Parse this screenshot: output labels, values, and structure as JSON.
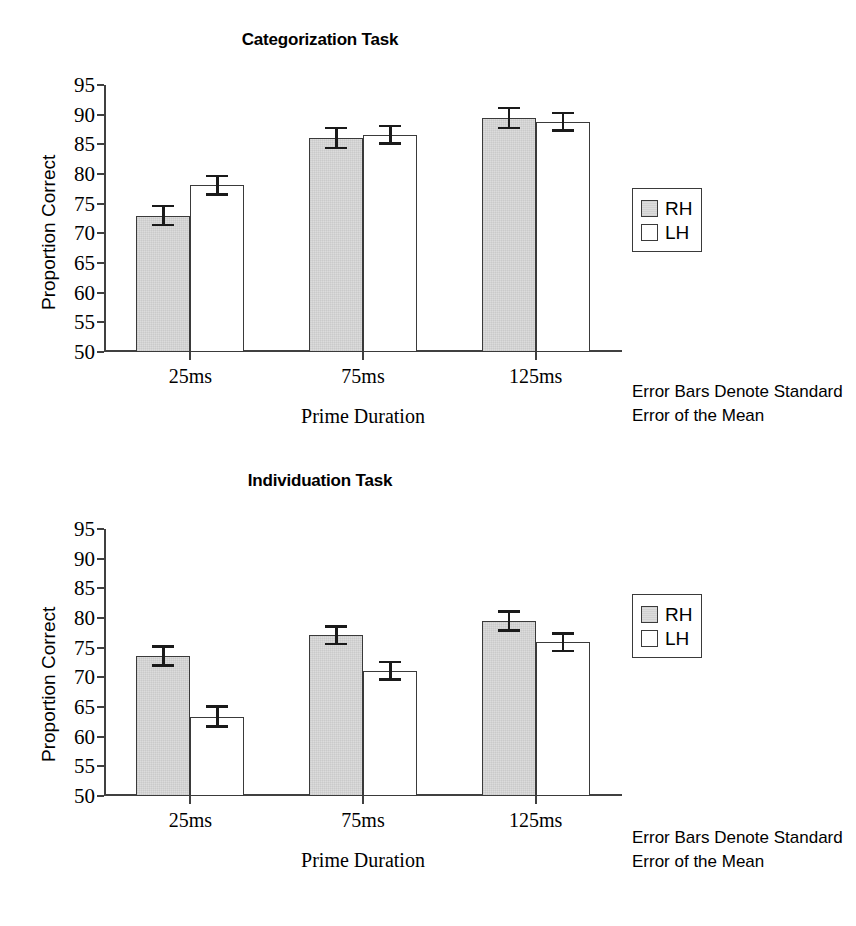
{
  "figure": {
    "background_color": "#ffffff",
    "bar_fill_rh": "#dcdcdc",
    "bar_fill_lh": "#ffffff",
    "bar_edge_color": "#3a3a3a",
    "axis_color": "#404040",
    "error_bar_color": "#1a1a1a"
  },
  "panels": [
    {
      "id": "categorization",
      "title": "Categorization Task",
      "ylabel": "Proportion Correct",
      "xlabel": "Prime Duration",
      "footnote": "Error Bars Denote Standard Error of the Mean",
      "legend": {
        "items": [
          {
            "label": "RH"
          },
          {
            "label": "LH"
          }
        ]
      },
      "yticks": [
        "95",
        "90",
        "85",
        "80",
        "75",
        "70",
        "65",
        "60",
        "55",
        "50"
      ],
      "xticks": [
        "25ms",
        "75ms",
        "125ms"
      ]
    },
    {
      "id": "individuation",
      "title": "Individuation Task",
      "ylabel": "Proportion Correct",
      "xlabel": "Prime Duration",
      "footnote": "Error Bars Denote Standard Error of the Mean",
      "legend": {
        "items": [
          {
            "label": "RH"
          },
          {
            "label": "LH"
          }
        ]
      },
      "yticks": [
        "95",
        "90",
        "85",
        "80",
        "75",
        "70",
        "65",
        "60",
        "55",
        "50"
      ],
      "xticks": [
        "25ms",
        "75ms",
        "125ms"
      ]
    }
  ],
  "chart_data": [
    {
      "type": "bar",
      "title": "Categorization Task",
      "xlabel": "Prime Duration",
      "ylabel": "Proportion Correct",
      "categories": [
        "25ms",
        "75ms",
        "125ms"
      ],
      "ylim": [
        50,
        95
      ],
      "yticks": [
        50,
        55,
        60,
        65,
        70,
        75,
        80,
        85,
        90,
        95
      ],
      "grid": false,
      "legend_position": "right",
      "annotation": "Error Bars Denote Standard Error of the Mean",
      "error_type": "standard error of the mean",
      "series": [
        {
          "name": "RH",
          "values": [
            73.0,
            86.1,
            89.4
          ],
          "errors": [
            1.8,
            1.9,
            1.9
          ],
          "fill": "#dcdcdc"
        },
        {
          "name": "LH",
          "values": [
            78.1,
            86.6,
            88.8
          ],
          "errors": [
            1.8,
            1.7,
            1.7
          ],
          "fill": "#ffffff"
        }
      ]
    },
    {
      "type": "bar",
      "title": "Individuation Task",
      "xlabel": "Prime Duration",
      "ylabel": "Proportion Correct",
      "categories": [
        "25ms",
        "75ms",
        "125ms"
      ],
      "ylim": [
        50,
        95
      ],
      "yticks": [
        50,
        55,
        60,
        65,
        70,
        75,
        80,
        85,
        90,
        95
      ],
      "grid": false,
      "legend_position": "right",
      "annotation": "Error Bars Denote Standard Error of the Mean",
      "error_type": "standard error of the mean",
      "series": [
        {
          "name": "RH",
          "values": [
            73.6,
            77.1,
            79.5
          ],
          "errors": [
            1.8,
            1.7,
            1.8
          ],
          "fill": "#dcdcdc"
        },
        {
          "name": "LH",
          "values": [
            63.4,
            71.1,
            75.9
          ],
          "errors": [
            1.9,
            1.7,
            1.7
          ],
          "fill": "#ffffff"
        }
      ]
    }
  ]
}
